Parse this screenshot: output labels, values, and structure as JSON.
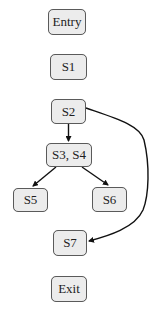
{
  "diagram": {
    "type": "control-flow-graph",
    "nodes": [
      {
        "id": "entry",
        "label": "Entry",
        "x": 48,
        "y": 9,
        "w": 38,
        "h": 26
      },
      {
        "id": "s1",
        "label": "S1",
        "x": 50,
        "y": 54,
        "w": 37,
        "h": 26
      },
      {
        "id": "s2",
        "label": "S2",
        "x": 51,
        "y": 99,
        "w": 35,
        "h": 25
      },
      {
        "id": "s3s4",
        "label": "S3, S4",
        "x": 46,
        "y": 143,
        "w": 46,
        "h": 24
      },
      {
        "id": "s5",
        "label": "S5",
        "x": 13,
        "y": 188,
        "w": 35,
        "h": 24
      },
      {
        "id": "s6",
        "label": "S6",
        "x": 92,
        "y": 187,
        "w": 35,
        "h": 25
      },
      {
        "id": "s7",
        "label": "S7",
        "x": 53,
        "y": 230,
        "w": 34,
        "h": 26
      },
      {
        "id": "exit",
        "label": "Exit",
        "x": 51,
        "y": 276,
        "w": 36,
        "h": 26
      }
    ],
    "edges": [
      {
        "from": "S2",
        "to": "S3, S4",
        "path": "M68.5 124 L68.5 141"
      },
      {
        "from": "S3, S4",
        "to": "S5",
        "path": "M56 167 L33 186"
      },
      {
        "from": "S3, S4",
        "to": "S6",
        "path": "M82 167 L108 185"
      },
      {
        "from": "S2",
        "to": "S7",
        "path": "M86 108 C 115 118, 140 125, 144 140 C 150 165, 149 195, 143 210 C 135 228, 108 236, 89 241"
      }
    ],
    "colors": {
      "node_fill": "#ececec",
      "node_border": "#5a5a5a",
      "text": "#1e1e1e",
      "edge": "#111111"
    }
  }
}
